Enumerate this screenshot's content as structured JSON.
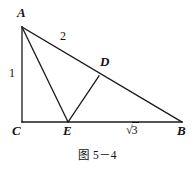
{
  "figure": {
    "caption": "图 5－4",
    "type": "geometry-diagram",
    "stroke_color": "#1a1a1a",
    "background_color": "#ffffff",
    "vertices": {
      "A": {
        "label": "A",
        "x": 22,
        "y": 27,
        "label_x": 17,
        "label_y": 6
      },
      "B": {
        "label": "B",
        "x": 182,
        "y": 122,
        "label_x": 177,
        "label_y": 124
      },
      "C": {
        "label": "C",
        "x": 22,
        "y": 122,
        "label_x": 12,
        "label_y": 124
      },
      "D": {
        "label": "D",
        "x": 99,
        "y": 76,
        "label_x": 100,
        "label_y": 55
      },
      "E": {
        "label": "E",
        "x": 68,
        "y": 122,
        "label_x": 63,
        "label_y": 124
      }
    },
    "segments": [
      {
        "name": "segment-AC",
        "from": "A",
        "to": "C"
      },
      {
        "name": "segment-CB",
        "from": "C",
        "to": "B"
      },
      {
        "name": "segment-AB",
        "from": "A",
        "to": "B"
      },
      {
        "name": "segment-AE",
        "from": "A",
        "to": "E"
      },
      {
        "name": "segment-ED",
        "from": "E",
        "to": "D"
      }
    ],
    "length_labels": {
      "ac": {
        "text": "1",
        "x": 9,
        "y": 67
      },
      "ad": {
        "text": "2",
        "x": 60,
        "y": 30
      },
      "eb_radical_sign": "√",
      "eb_radicand": "3",
      "eb_x": 126,
      "eb_y": 124
    }
  }
}
